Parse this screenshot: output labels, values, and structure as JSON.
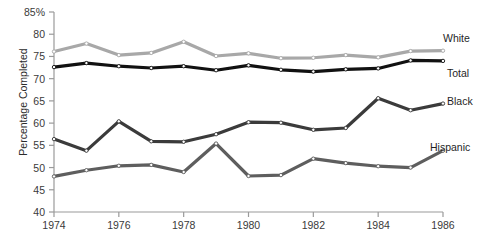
{
  "chart_data": {
    "type": "line",
    "title": "",
    "xlabel": "",
    "ylabel": "Percentage Completed",
    "x": [
      1974,
      1975,
      1976,
      1977,
      1978,
      1979,
      1980,
      1981,
      1982,
      1983,
      1984,
      1985,
      1986
    ],
    "xlim": [
      1974,
      1986
    ],
    "ylim": [
      40,
      85
    ],
    "yticks": [
      "85%",
      "80",
      "75",
      "70",
      "65",
      "60",
      "55",
      "50",
      "45",
      "40"
    ],
    "ytick_values": [
      85,
      80,
      75,
      70,
      65,
      60,
      55,
      50,
      45,
      40
    ],
    "xticks": [
      "1974",
      "1976",
      "1978",
      "1980",
      "1982",
      "1984",
      "1986"
    ],
    "xtick_values": [
      1974,
      1976,
      1978,
      1980,
      1982,
      1984,
      1986
    ],
    "grid": false,
    "legend_position": "right-inline",
    "markers": "open-circle",
    "series": [
      {
        "name": "White",
        "color": "#a8a8a8",
        "values": [
          76.1,
          77.9,
          75.3,
          75.8,
          78.3,
          75.1,
          75.7,
          74.6,
          74.7,
          75.3,
          74.8,
          76.2,
          76.3
        ]
      },
      {
        "name": "Total",
        "color": "#111111",
        "values": [
          72.6,
          73.5,
          72.8,
          72.4,
          72.8,
          71.9,
          73.0,
          72.0,
          71.6,
          72.1,
          72.3,
          74.1,
          74.0
        ]
      },
      {
        "name": "Black",
        "color": "#3b3b3b",
        "values": [
          56.4,
          53.8,
          60.4,
          55.9,
          55.8,
          57.5,
          60.2,
          60.1,
          58.5,
          58.9,
          65.6,
          62.9,
          64.4
        ]
      },
      {
        "name": "Hispanic",
        "color": "#5e5e5e",
        "values": [
          48.0,
          49.4,
          50.4,
          50.6,
          49.0,
          55.4,
          48.1,
          48.3,
          52.0,
          51.0,
          50.3,
          50.0,
          53.8
        ]
      }
    ]
  },
  "labels": {
    "white": "White",
    "total": "Total",
    "black": "Black",
    "hispanic": "Hispanic"
  },
  "axis_color": "#9a9a9a"
}
